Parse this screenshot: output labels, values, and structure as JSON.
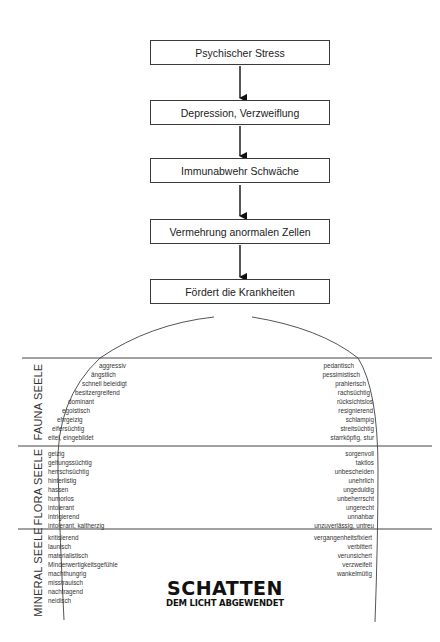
{
  "flow": {
    "boxes": [
      {
        "label": "Psychischer Stress"
      },
      {
        "label": "Depression, Verzweiflung"
      },
      {
        "label": "Immunabwehr Schwäche"
      },
      {
        "label": "Vermehrung anormalen Zellen"
      },
      {
        "label": "Fördert die Krankheiten"
      }
    ]
  },
  "sections": {
    "fauna": {
      "label": "FAUNA SEELE",
      "left": [
        "aggressiv",
        "ängstlich",
        "schnell beleidigt",
        "besitzergreifend",
        "dominant",
        "egoistisch",
        "ehrgeizig",
        "eifersüchtig",
        "eitel, eingebildet"
      ],
      "right": [
        "pedantisch",
        "pessimistisch",
        "prahlerisch",
        "rachsüchtig",
        "rücksichtslos",
        "resignierend",
        "schlampig",
        "streitsüchtig",
        "starrköpfig, stur"
      ]
    },
    "flora": {
      "label": "FLORA SEELE",
      "left": [
        "geizig",
        "geltungssüchtig",
        "herrschsüchtig",
        "hinterlistig",
        "hassen",
        "humorlos",
        "intolerant",
        "intrigierend",
        "intolerant, kaltherzig"
      ],
      "right": [
        "sorgenvoll",
        "taktlos",
        "unbescheiden",
        "unehrlich",
        "ungeduldig",
        "unbeherrscht",
        "ungerecht",
        "unnahbar",
        "unzuverlässig, untreu"
      ]
    },
    "mineral": {
      "label": "MINERAL SEELE",
      "left": [
        "kritisierend",
        "launisch",
        "materialistisch",
        "Minderwertigkeitsgefühle",
        "machthungrig",
        "misstrauisch",
        "nachtragend",
        "neidisch"
      ],
      "right": [
        "vergangenheitsfixiert",
        "verbittert",
        "verunsichert",
        "verzweifelt",
        "wankelmütig"
      ]
    }
  },
  "footer": {
    "title": "SCHATTEN",
    "subtitle": "DEM LICHT ABGEWENDET"
  },
  "colors": {
    "line": "#3a3a3a",
    "text": "#222222",
    "background": "#ffffff"
  }
}
